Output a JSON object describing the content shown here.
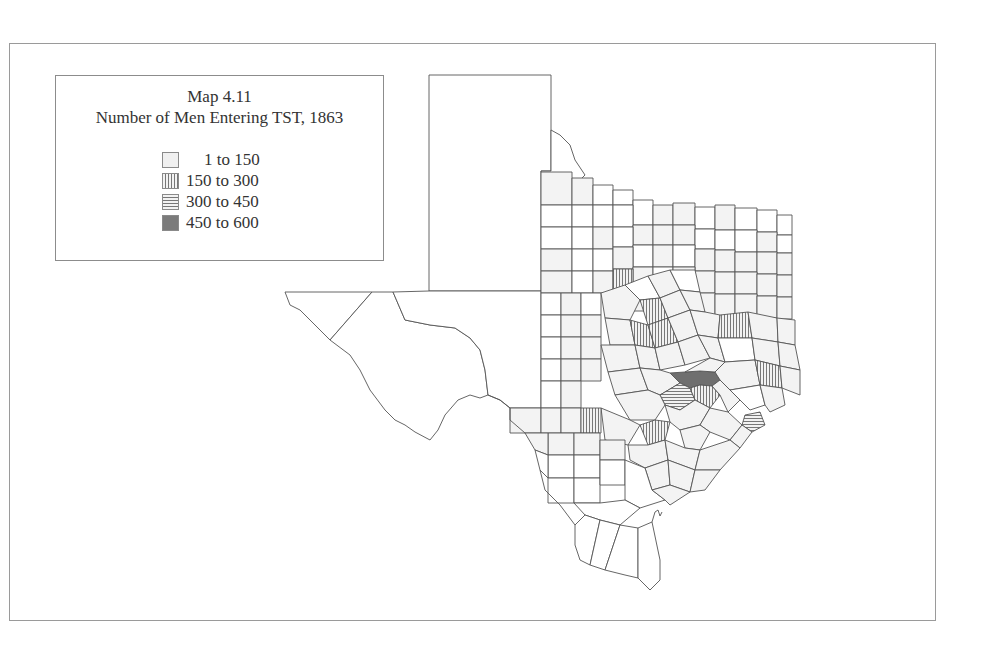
{
  "map": {
    "title": "Map 4.11",
    "subtitle": "Number of Men Entering TST, 1863",
    "region": "Texas (counties)",
    "legend": [
      {
        "label": "1 to 150",
        "pattern": "light-dotted",
        "color": "#f0f0f0"
      },
      {
        "label": "150 to 300",
        "pattern": "vertical-hatch",
        "color": "#777777"
      },
      {
        "label": "300 to 450",
        "pattern": "horizontal-hatch",
        "color": "#777777"
      },
      {
        "label": "450 to 600",
        "pattern": "dark-fill",
        "color": "#7b7b7b"
      }
    ],
    "highlighted_counties": {
      "450_to_600": [
        "central Texas county (Travis/Bastrop area)"
      ],
      "300_to_450": [
        "county south of darkest county",
        "Gulf coast county near Galveston Bay"
      ],
      "150_to_300": [
        "several central and east Texas counties",
        "south Texas border-area county"
      ]
    }
  }
}
